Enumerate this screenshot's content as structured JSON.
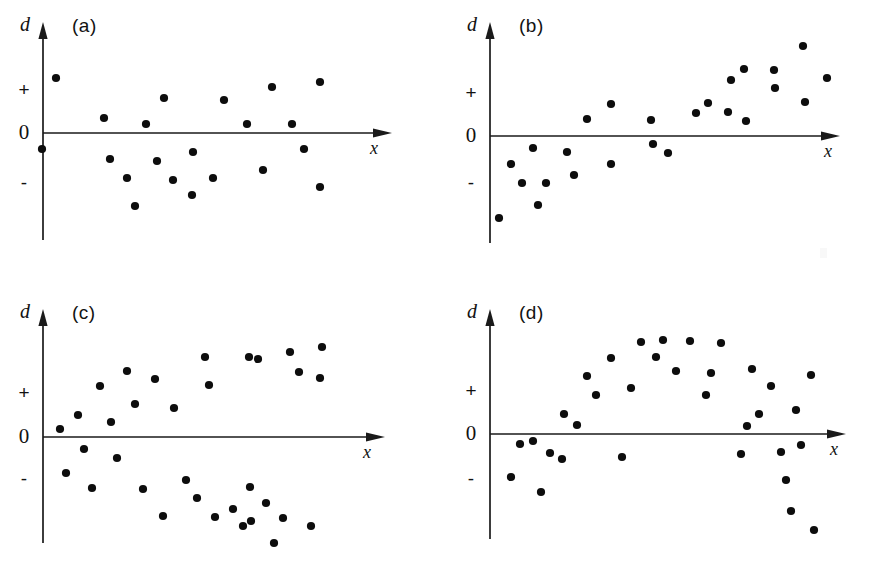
{
  "figure": {
    "background_color": "#ffffff",
    "ink_color": "#111111",
    "point_color": "#0d0d0d",
    "width": 881,
    "height": 562
  },
  "axis_labels": {
    "y": "d",
    "x": "x",
    "tick_plus": "+",
    "tick_zero": "0",
    "tick_minus": "-"
  },
  "panels": [
    {
      "id": "a",
      "label": "(a)",
      "origin_x": 0,
      "origin_y": 0,
      "pattern": "random scatter / homoscedastic residuals",
      "chart_index": 0
    },
    {
      "id": "b",
      "label": "(b)",
      "origin_x": 441,
      "origin_y": 0,
      "pattern": "linear increasing trend in residuals",
      "chart_index": 1
    },
    {
      "id": "c",
      "label": "(c)",
      "origin_x": 0,
      "origin_y": 281,
      "pattern": "fanning / diverging residuals",
      "chart_index": 2
    },
    {
      "id": "d",
      "label": "(d)",
      "origin_x": 441,
      "origin_y": 281,
      "pattern": "curvature / quadratic residuals",
      "chart_index": 3
    }
  ],
  "chart_data": [
    {
      "type": "scatter",
      "title": "(a)",
      "xlabel": "x",
      "ylabel": "d",
      "ytick_labels": [
        "+",
        "0",
        "-"
      ],
      "ytick_values": [
        1,
        0,
        -1
      ],
      "grid": false,
      "legend": null,
      "axis_geometry": {
        "y_axis_x": 43,
        "x_axis_y": 133,
        "y_axis_top": 22,
        "y_axis_bottom": 240,
        "x_axis_right": 392,
        "plus_y": 89,
        "minus_y": 182
      },
      "points": [
        [
          42,
          149
        ],
        [
          56,
          78
        ],
        [
          104,
          118
        ],
        [
          110,
          159
        ],
        [
          127,
          178
        ],
        [
          135,
          206
        ],
        [
          146,
          124
        ],
        [
          157,
          161
        ],
        [
          164,
          98
        ],
        [
          173,
          180
        ],
        [
          192,
          195
        ],
        [
          193,
          152
        ],
        [
          213,
          178
        ],
        [
          224,
          100
        ],
        [
          247,
          124
        ],
        [
          263,
          170
        ],
        [
          272,
          87
        ],
        [
          292,
          124
        ],
        [
          304,
          149
        ],
        [
          320,
          82
        ],
        [
          320,
          187
        ]
      ]
    },
    {
      "type": "scatter",
      "title": "(b)",
      "xlabel": "x",
      "ylabel": "d",
      "ytick_labels": [
        "+",
        "0",
        "-"
      ],
      "ytick_values": [
        1,
        0,
        -1
      ],
      "grid": false,
      "legend": null,
      "axis_geometry": {
        "y_axis_x": 49,
        "x_axis_y": 136,
        "y_axis_top": 22,
        "y_axis_bottom": 243,
        "x_axis_right": 399,
        "plus_y": 92,
        "minus_y": 182
      },
      "points": [
        [
          58,
          218
        ],
        [
          70,
          164
        ],
        [
          81,
          183
        ],
        [
          92,
          148
        ],
        [
          97,
          205
        ],
        [
          105,
          183
        ],
        [
          126,
          152
        ],
        [
          133,
          175
        ],
        [
          146,
          119
        ],
        [
          170,
          104
        ],
        [
          170,
          164
        ],
        [
          210,
          120
        ],
        [
          212,
          144
        ],
        [
          227,
          153
        ],
        [
          255,
          113
        ],
        [
          267,
          103
        ],
        [
          287,
          112
        ],
        [
          290,
          80
        ],
        [
          303,
          69
        ],
        [
          305,
          121
        ],
        [
          333,
          70
        ],
        [
          334,
          88
        ],
        [
          362,
          46
        ],
        [
          364,
          102
        ],
        [
          386,
          78
        ]
      ]
    },
    {
      "type": "scatter",
      "title": "(c)",
      "xlabel": "x",
      "ylabel": "d",
      "ytick_labels": [
        "+",
        "0",
        "-"
      ],
      "ytick_values": [
        1,
        0,
        -1
      ],
      "grid": false,
      "legend": null,
      "axis_geometry": {
        "y_axis_x": 43,
        "x_axis_y": 156,
        "y_axis_top": 28,
        "y_axis_bottom": 262,
        "x_axis_right": 385,
        "plus_y": 111,
        "minus_y": 197
      },
      "points": [
        [
          60,
          148
        ],
        [
          66,
          192
        ],
        [
          78,
          134
        ],
        [
          84,
          168
        ],
        [
          92,
          207
        ],
        [
          100,
          105
        ],
        [
          111,
          141
        ],
        [
          117,
          177
        ],
        [
          127,
          90
        ],
        [
          135,
          123
        ],
        [
          143,
          208
        ],
        [
          155,
          98
        ],
        [
          163,
          235
        ],
        [
          174,
          127
        ],
        [
          186,
          199
        ],
        [
          197,
          217
        ],
        [
          205,
          76
        ],
        [
          209,
          104
        ],
        [
          215,
          236
        ],
        [
          233,
          228
        ],
        [
          243,
          245
        ],
        [
          249,
          76
        ],
        [
          250,
          206
        ],
        [
          251,
          240
        ],
        [
          258,
          78
        ],
        [
          266,
          222
        ],
        [
          274,
          262
        ],
        [
          283,
          237
        ],
        [
          290,
          71
        ],
        [
          299,
          91
        ],
        [
          311,
          245
        ],
        [
          322,
          66
        ],
        [
          320,
          97
        ]
      ]
    },
    {
      "type": "scatter",
      "title": "(d)",
      "xlabel": "x",
      "ylabel": "d",
      "ytick_labels": [
        "+",
        "0",
        "-"
      ],
      "ytick_values": [
        1,
        0,
        -1
      ],
      "grid": false,
      "legend": null,
      "axis_geometry": {
        "y_axis_x": 49,
        "x_axis_y": 153,
        "y_axis_top": 28,
        "y_axis_bottom": 258,
        "x_axis_right": 405,
        "plus_y": 109,
        "minus_y": 197
      },
      "points": [
        [
          70,
          196
        ],
        [
          79,
          163
        ],
        [
          92,
          160
        ],
        [
          100,
          211
        ],
        [
          109,
          172
        ],
        [
          121,
          178
        ],
        [
          123,
          133
        ],
        [
          136,
          144
        ],
        [
          146,
          95
        ],
        [
          155,
          114
        ],
        [
          170,
          77
        ],
        [
          181,
          176
        ],
        [
          190,
          107
        ],
        [
          200,
          61
        ],
        [
          215,
          76
        ],
        [
          222,
          59
        ],
        [
          235,
          90
        ],
        [
          249,
          60
        ],
        [
          265,
          114
        ],
        [
          270,
          92
        ],
        [
          280,
          62
        ],
        [
          300,
          173
        ],
        [
          306,
          145
        ],
        [
          311,
          88
        ],
        [
          318,
          133
        ],
        [
          330,
          105
        ],
        [
          340,
          171
        ],
        [
          345,
          199
        ],
        [
          350,
          230
        ],
        [
          355,
          129
        ],
        [
          360,
          164
        ],
        [
          370,
          94
        ],
        [
          373,
          249
        ]
      ]
    }
  ]
}
